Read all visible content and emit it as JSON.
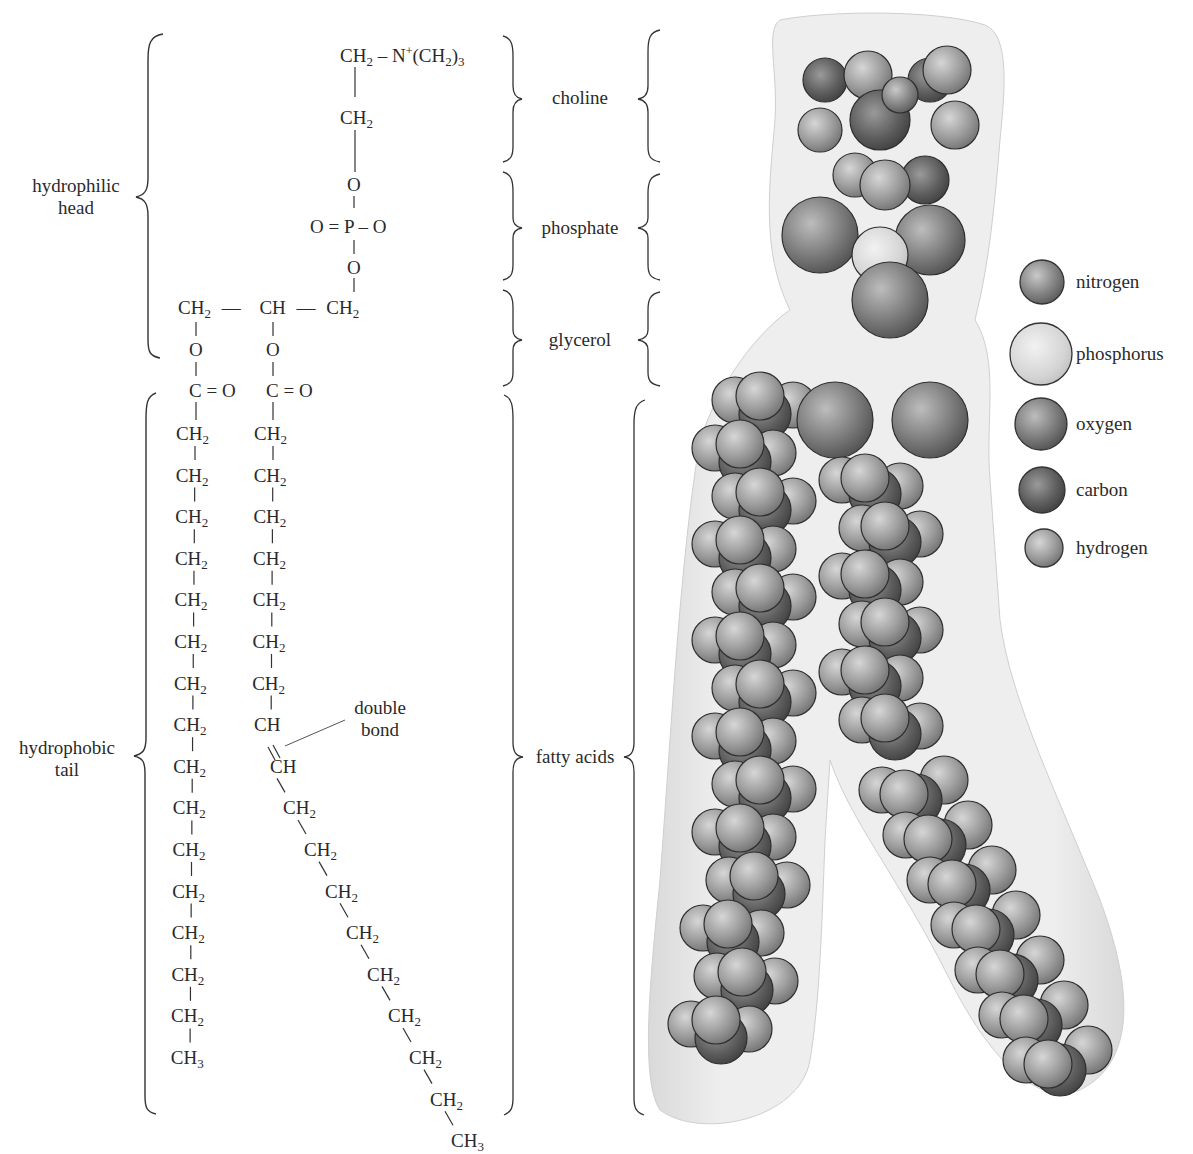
{
  "figure": {
    "regions": {
      "hydrophilic_head": [
        "hydrophilic",
        "head"
      ],
      "hydrophobic_tail": [
        "hydrophobic",
        "tail"
      ]
    },
    "groups": {
      "choline": "choline",
      "phosphate": "phosphate",
      "glycerol": "glycerol",
      "fatty_acids": "fatty acids"
    },
    "annotation": {
      "double_bond": [
        "double",
        "bond"
      ]
    },
    "formula": {
      "choline_top": {
        "ch": "CH",
        "sub": "2",
        "dash": "– N",
        "plus": "+",
        "paren": "(CH",
        "sub2": "2",
        "close": ")",
        "sub3": "3"
      },
      "choline_ch2": {
        "ch": "CH",
        "sub": "2"
      },
      "phosphate": {
        "o_top": "O",
        "center": "O = P – O",
        "o_bottom": "O"
      },
      "glycerol": {
        "left": "CH",
        "left_sub": "2",
        "dash1": "—",
        "mid": "CH",
        "dash2": "—",
        "right": "CH",
        "right_sub": "2"
      },
      "ester": {
        "o": "O",
        "carbonyl": "C = O"
      },
      "left_chain": {
        "ch2": "CH",
        "sub": "2",
        "count": 15,
        "terminal": "CH",
        "terminal_sub": "3"
      },
      "right_chain": {
        "ch2": "CH",
        "sub": "2",
        "ch": "CH",
        "terminal": "CH",
        "terminal_sub": "3"
      }
    },
    "legend": [
      {
        "element": "nitrogen",
        "size": 48,
        "color": "#8e8e8e"
      },
      {
        "element": "phosphorus",
        "size": 64,
        "color": "#d8d8d8"
      },
      {
        "element": "oxygen",
        "size": 56,
        "color": "#7a7a7a"
      },
      {
        "element": "carbon",
        "size": 50,
        "color": "#555555"
      },
      {
        "element": "hydrogen",
        "size": 42,
        "color": "#9a9a9a"
      }
    ]
  }
}
